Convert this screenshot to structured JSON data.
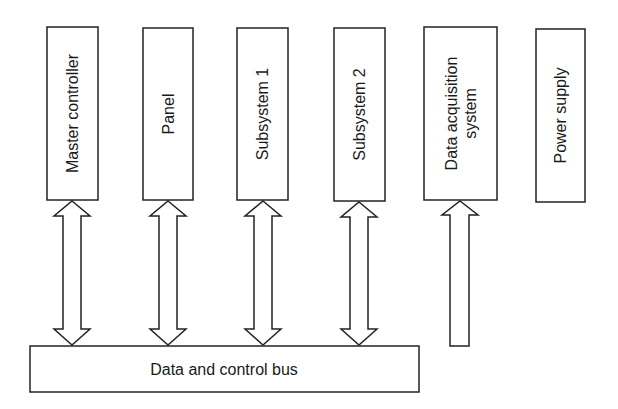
{
  "diagram": {
    "stroke_color": "#222222",
    "background": "#ffffff",
    "modules": [
      {
        "id": "master-controller",
        "lines": [
          "Master controller"
        ],
        "x": 47,
        "y": 27,
        "w": 51,
        "h": 173,
        "arrow": "bidirectional"
      },
      {
        "id": "panel",
        "lines": [
          "Panel"
        ],
        "x": 143,
        "y": 28,
        "w": 50,
        "h": 172,
        "arrow": "bidirectional"
      },
      {
        "id": "subsystem-1",
        "lines": [
          "Subsystem 1"
        ],
        "x": 237,
        "y": 28,
        "w": 51,
        "h": 172,
        "arrow": "bidirectional"
      },
      {
        "id": "subsystem-2",
        "lines": [
          "Subsystem 2"
        ],
        "x": 334,
        "y": 28,
        "w": 51,
        "h": 173,
        "arrow": "bidirectional"
      },
      {
        "id": "data-acquisition-system",
        "lines": [
          "Data acquisition",
          "system"
        ],
        "x": 424,
        "y": 27,
        "w": 73,
        "h": 173,
        "arrow": "up"
      },
      {
        "id": "power-supply",
        "lines": [
          "Power supply"
        ],
        "x": 536,
        "y": 29,
        "w": 49,
        "h": 173,
        "arrow": "none"
      }
    ],
    "bus": {
      "label": "Data and control bus",
      "x": 30,
      "y": 346,
      "w": 389,
      "h": 46
    }
  }
}
